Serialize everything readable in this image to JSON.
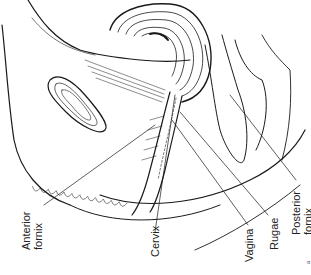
{
  "figure": {
    "labels": [
      {
        "id": "anterior-fornix",
        "lines": [
          "Anterior",
          "fornix"
        ]
      },
      {
        "id": "cervix",
        "lines": [
          "Cervix"
        ]
      },
      {
        "id": "vagina",
        "lines": [
          "Vagina"
        ]
      },
      {
        "id": "rugae",
        "lines": [
          "Rugae"
        ]
      },
      {
        "id": "posterior-fornix",
        "lines": [
          "Posterior",
          "fornix"
        ]
      }
    ],
    "corner_mark": "a"
  }
}
